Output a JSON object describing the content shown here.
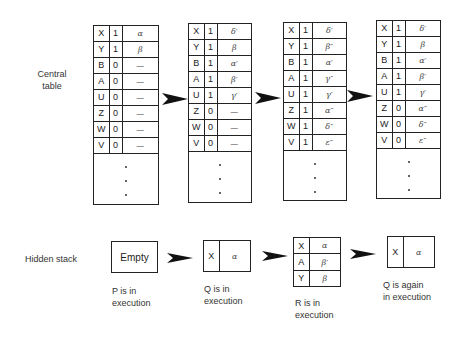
{
  "labels": {
    "central_table": "Central\ntable",
    "central_line1": "Central",
    "central_line2": "table",
    "hidden_stack": "Hidden stack"
  },
  "central_tables": [
    {
      "rows": [
        {
          "var": "X",
          "flag": "1",
          "value": "α"
        },
        {
          "var": "Y",
          "flag": "1",
          "value": "β"
        },
        {
          "var": "B",
          "flag": "0",
          "value": "—"
        },
        {
          "var": "A",
          "flag": "0",
          "value": "—"
        },
        {
          "var": "U",
          "flag": "0",
          "value": "—"
        },
        {
          "var": "Z",
          "flag": "0",
          "value": "—"
        },
        {
          "var": "W",
          "flag": "0",
          "value": "—"
        },
        {
          "var": "V",
          "flag": "0",
          "value": "—"
        }
      ]
    },
    {
      "rows": [
        {
          "var": "X",
          "flag": "1",
          "value": "δ′"
        },
        {
          "var": "Y",
          "flag": "1",
          "value": "β"
        },
        {
          "var": "B",
          "flag": "1",
          "value": "α′"
        },
        {
          "var": "A",
          "flag": "1",
          "value": "β′"
        },
        {
          "var": "U",
          "flag": "1",
          "value": "γ′"
        },
        {
          "var": "Z",
          "flag": "0",
          "value": "—"
        },
        {
          "var": "W",
          "flag": "0",
          "value": "—"
        },
        {
          "var": "V",
          "flag": "0",
          "value": "—"
        }
      ]
    },
    {
      "rows": [
        {
          "var": "X",
          "flag": "1",
          "value": "δ′"
        },
        {
          "var": "Y",
          "flag": "1",
          "value": "β″"
        },
        {
          "var": "B",
          "flag": "1",
          "value": "α′"
        },
        {
          "var": "A",
          "flag": "1",
          "value": "γ″"
        },
        {
          "var": "U",
          "flag": "1",
          "value": "γ′"
        },
        {
          "var": "Z",
          "flag": "1",
          "value": "α″"
        },
        {
          "var": "W",
          "flag": "1",
          "value": "δ″"
        },
        {
          "var": "V",
          "flag": "1",
          "value": "ε″"
        }
      ]
    },
    {
      "rows": [
        {
          "var": "X",
          "flag": "1",
          "value": "δ′"
        },
        {
          "var": "Y",
          "flag": "1",
          "value": "β"
        },
        {
          "var": "B",
          "flag": "1",
          "value": "α′"
        },
        {
          "var": "A",
          "flag": "1",
          "value": "β′"
        },
        {
          "var": "U",
          "flag": "1",
          "value": "γ′"
        },
        {
          "var": "Z",
          "flag": "0",
          "value": "α″"
        },
        {
          "var": "W",
          "flag": "0",
          "value": "δ″"
        },
        {
          "var": "V",
          "flag": "0",
          "value": "ε″"
        }
      ]
    }
  ],
  "hidden_stacks": [
    {
      "empty_label": "Empty",
      "rows": [],
      "caption_line1": "P is in",
      "caption_line2": "execution"
    },
    {
      "rows": [
        {
          "var": "X",
          "value": "α"
        }
      ],
      "caption_line1": "Q is in",
      "caption_line2": "execution"
    },
    {
      "rows": [
        {
          "var": "X",
          "value": "α"
        },
        {
          "var": "A",
          "value": "β′"
        },
        {
          "var": "Y",
          "value": "β"
        }
      ],
      "caption_line1": "R is in",
      "caption_line2": "execution"
    },
    {
      "rows": [
        {
          "var": "X",
          "value": "α"
        }
      ],
      "caption_line1": "Q is again",
      "caption_line2": "in execution"
    }
  ]
}
